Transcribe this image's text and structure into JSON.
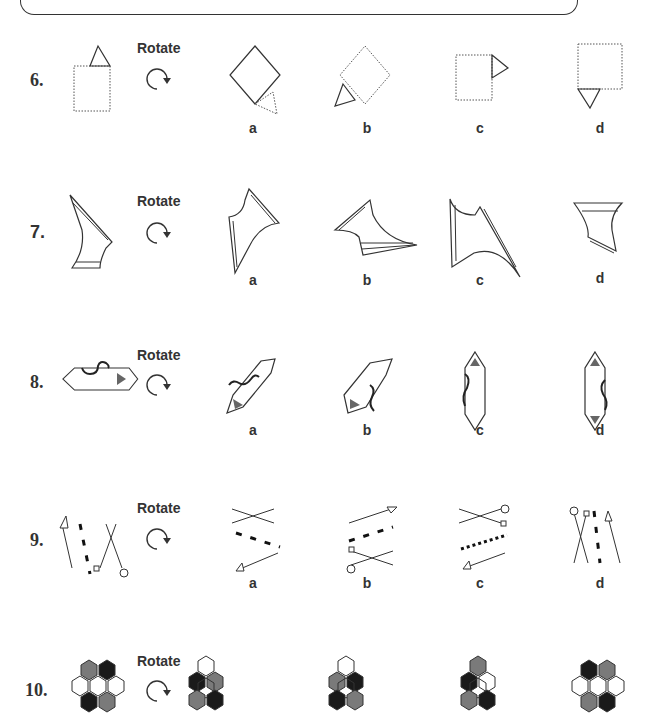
{
  "worksheet": {
    "rotate_label": "Rotate",
    "questions": [
      {
        "number": "6.",
        "instruction": "Rotate",
        "options": [
          "a",
          "b",
          "c",
          "d"
        ]
      },
      {
        "number": "7.",
        "instruction": "Rotate",
        "options": [
          "a",
          "b",
          "c",
          "d"
        ]
      },
      {
        "number": "8.",
        "instruction": "Rotate",
        "options": [
          "a",
          "b",
          "c",
          "d"
        ]
      },
      {
        "number": "9.",
        "instruction": "Rotate",
        "options": [
          "a",
          "b",
          "c",
          "d"
        ]
      },
      {
        "number": "10.",
        "instruction": "Rotate",
        "options": []
      }
    ],
    "icons": {
      "rotate": "clockwise-arrow-icon"
    },
    "colors": {
      "stroke": "#333333",
      "gray_fill": "#7a7a7a",
      "black_fill": "#1a1a1a",
      "white_fill": "#ffffff"
    }
  }
}
